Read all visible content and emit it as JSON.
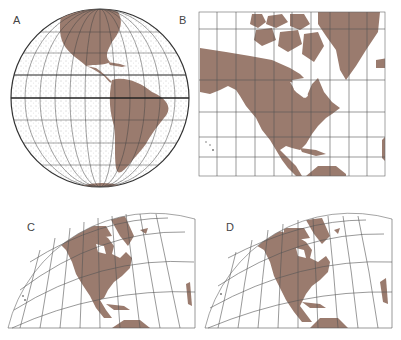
{
  "figure": {
    "panels": [
      {
        "id": "A",
        "label": "A",
        "description": "Orthographic globe view of the Americas"
      },
      {
        "id": "B",
        "label": "B",
        "description": "Rectangular (cylindrical) grid map of North America"
      },
      {
        "id": "C",
        "label": "C",
        "description": "Conic projection of North America"
      },
      {
        "id": "D",
        "label": "D",
        "description": "Conic/polyconic projection of North America"
      }
    ]
  },
  "colors": {
    "land": "#9a7b6e",
    "grid": "#555555",
    "ocean_stipple": "#777777",
    "background": "#ffffff"
  }
}
